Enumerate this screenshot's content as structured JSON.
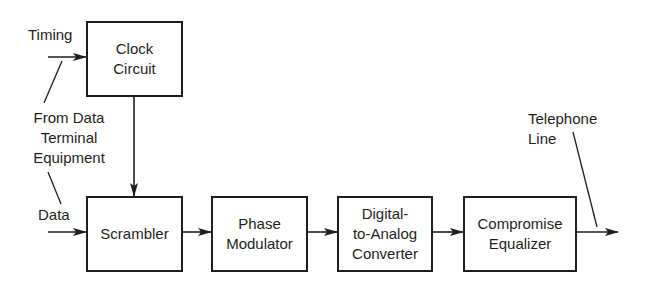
{
  "diagram": {
    "type": "block-diagram",
    "blocks": [
      {
        "id": "clock",
        "label": "Clock Circuit",
        "lines": [
          "Clock",
          "Circuit"
        ]
      },
      {
        "id": "scrambler",
        "label": "Scrambler",
        "lines": [
          "Scrambler"
        ]
      },
      {
        "id": "phase_mod",
        "label": "Phase Modulator",
        "lines": [
          "Phase",
          "Modulator"
        ]
      },
      {
        "id": "dac",
        "label": "Digital-to-Analog Converter",
        "lines": [
          "Digital-",
          "to-Analog",
          "Converter"
        ]
      },
      {
        "id": "equalizer",
        "label": "Compromise Equalizer",
        "lines": [
          "Compromise",
          "Equalizer"
        ]
      }
    ],
    "labels": {
      "timing": "Timing",
      "from_dte": [
        "From Data",
        "Terminal",
        "Equipment"
      ],
      "data": "Data",
      "telephone_line": [
        "Telephone",
        "Line"
      ]
    },
    "connections": [
      {
        "from": "Timing input",
        "to": "clock"
      },
      {
        "from": "clock",
        "to": "scrambler"
      },
      {
        "from": "Data input",
        "to": "scrambler"
      },
      {
        "from": "scrambler",
        "to": "phase_mod"
      },
      {
        "from": "phase_mod",
        "to": "dac"
      },
      {
        "from": "dac",
        "to": "equalizer"
      },
      {
        "from": "equalizer",
        "to": "Telephone Line output"
      }
    ],
    "colors": {
      "line": "#1e1e1e",
      "background": "#ffffff"
    }
  }
}
